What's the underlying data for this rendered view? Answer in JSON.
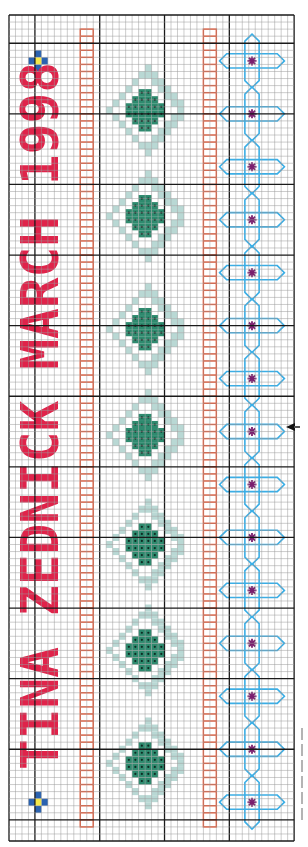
{
  "text_motif": {
    "label": "TINA ZEDNICK MARCH 1998",
    "orientation": "rotated-90-ccw",
    "color": "#e0234a"
  },
  "grid": {
    "left": 9,
    "top": 15,
    "cols": 44,
    "rows": 117,
    "cell_w": 6.48,
    "cell_h": 7.06,
    "thick_every": 10,
    "thick_col_offset": 4,
    "thick_row_offset": 4,
    "thin_color": "#9a9a9a",
    "thick_color": "#1a1a1a"
  },
  "colors": {
    "text_red": "#e0234a",
    "ladder_orange": "#f0502a",
    "diamond_dark": "#2e8a6e",
    "diamond_dots": "#0e2a22",
    "diamond_light": "#b9d8d4",
    "cross_outline": "#3aaee6",
    "cross_star": "#7a1f6e",
    "flower_blue": "#2a62b0",
    "flower_center": "#f4e84a"
  },
  "flowers": [
    {
      "col": 4,
      "row": 6
    },
    {
      "col": 4,
      "row": 111
    }
  ],
  "ladders": [
    {
      "col": 11,
      "row_start": 2,
      "row_end": 115
    },
    {
      "col": 30,
      "row_start": 2,
      "row_end": 115
    }
  ],
  "diamonds": {
    "center_col": 21,
    "center_rows": [
      13.5,
      28.5,
      44.5,
      59.5,
      75,
      90,
      106
    ]
  },
  "crosses": {
    "center_col": 37,
    "star_rows": [
      6,
      13.5,
      21,
      28.5,
      36,
      43.5,
      51,
      58.5,
      66,
      73.5,
      81,
      88.5,
      96,
      103.5,
      111
    ]
  },
  "marker": {
    "label": "center-arrow",
    "row": 58.5
  }
}
